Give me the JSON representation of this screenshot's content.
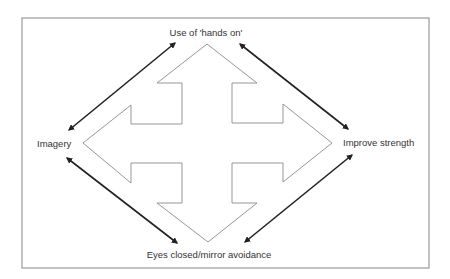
{
  "diagram": {
    "labels": {
      "top": "Use of 'hands on'",
      "left": "Imagery",
      "right": "Improve strength",
      "bottom": "Eyes closed/mirror avoidance"
    },
    "colors": {
      "frame": "#9a9a9a",
      "cross_outline": "#8a8a8a",
      "arrows": "#222222",
      "text": "#333333",
      "background": "#ffffff"
    },
    "frame": {
      "x": 22,
      "y": 18,
      "width": 407,
      "height": 250
    },
    "cross": {
      "shape": "four-way arrow outline",
      "center": [
        207,
        143
      ],
      "points": [
        [
          207,
          44
        ],
        [
          257,
          83
        ],
        [
          232,
          83
        ],
        [
          232,
          123
        ],
        [
          283,
          123
        ],
        [
          283,
          104
        ],
        [
          332,
          143
        ],
        [
          283,
          182
        ],
        [
          283,
          163
        ],
        [
          232,
          163
        ],
        [
          232,
          203
        ],
        [
          257,
          203
        ],
        [
          208,
          242
        ],
        [
          157,
          203
        ],
        [
          182,
          203
        ],
        [
          182,
          163
        ],
        [
          131,
          163
        ],
        [
          131,
          183
        ],
        [
          83,
          143
        ],
        [
          131,
          105
        ],
        [
          131,
          124
        ],
        [
          182,
          124
        ],
        [
          182,
          83
        ],
        [
          157,
          83
        ]
      ]
    },
    "connectors": [
      {
        "from": "Imagery",
        "to": "Use of 'hands on'",
        "type": "double-headed arrow",
        "x1": 69,
        "y1": 130,
        "x2": 175,
        "y2": 43
      },
      {
        "from": "Use of 'hands on'",
        "to": "Improve strength",
        "type": "double-headed arrow",
        "x1": 240,
        "y1": 44,
        "x2": 348,
        "y2": 129
      },
      {
        "from": "Imagery",
        "to": "Eyes closed/mirror avoidance",
        "type": "double-headed arrow",
        "x1": 67,
        "y1": 158,
        "x2": 177,
        "y2": 243
      },
      {
        "from": "Improve strength",
        "to": "Eyes closed/mirror avoidance",
        "type": "double-headed arrow",
        "x1": 352,
        "y1": 155,
        "x2": 245,
        "y2": 242
      }
    ]
  }
}
